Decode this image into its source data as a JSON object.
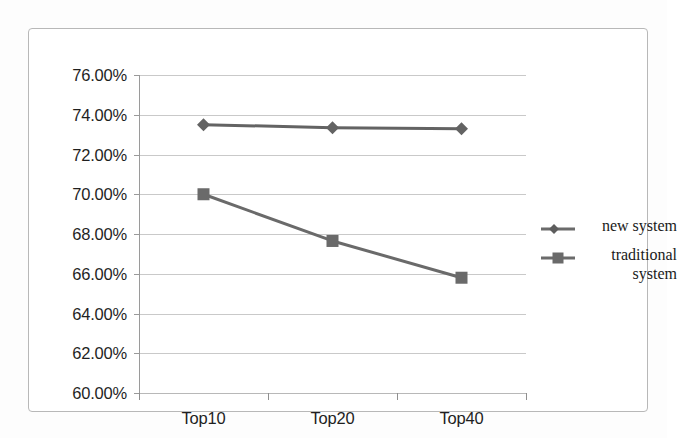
{
  "chart_data": {
    "type": "line",
    "title": "",
    "subtitle": "",
    "xlabel": "",
    "ylabel": "",
    "categories": [
      "Top10",
      "Top20",
      "Top40"
    ],
    "series": [
      {
        "name": "new system",
        "marker": "diamond",
        "color": "#636363",
        "values": [
          73.5,
          73.35,
          73.3
        ],
        "value_labels": [
          "73.50%",
          "73.35%",
          "73.30%"
        ]
      },
      {
        "name": "traditional system",
        "marker": "square",
        "color": "#6a6a6a",
        "values": [
          70.0,
          67.65,
          65.8
        ],
        "value_labels": [
          "70.00%",
          "67.65%",
          "65.80%"
        ]
      }
    ],
    "ylim": [
      60.0,
      76.0
    ],
    "ytick_step": 2.0,
    "ytick_values": [
      76.0,
      74.0,
      72.0,
      70.0,
      68.0,
      66.0,
      64.0,
      62.0,
      60.0
    ],
    "ytick_labels": [
      "76.00%",
      "74.00%",
      "72.00%",
      "70.00%",
      "68.00%",
      "66.00%",
      "64.00%",
      "62.00%",
      "60.00%"
    ],
    "grid": true,
    "grid_axis": "y",
    "legend_position": "right",
    "legend_entries": [
      "new system",
      "traditional system"
    ],
    "value_format": "percent"
  },
  "colors": {
    "gridline": "#bfbfbf",
    "axis": "#8f8f8f",
    "frame": "#b8b8b8",
    "text": "#1f1f1f",
    "series_new_system": "#636363",
    "series_traditional_system": "#6a6a6a",
    "background": "#ffffff"
  },
  "legend": {
    "items": [
      {
        "label": "new system",
        "marker": "diamond-marker-icon"
      },
      {
        "label": "traditional system",
        "marker": "square-marker-icon"
      }
    ]
  }
}
